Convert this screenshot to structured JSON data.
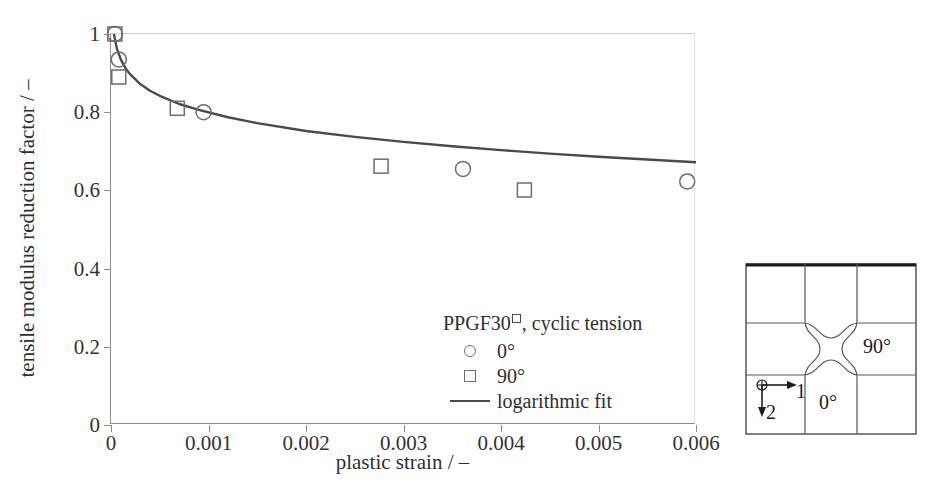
{
  "chart_data": {
    "type": "scatter",
    "title": "",
    "xlabel": "plastic strain / –",
    "ylabel": "tensile modulus reduction factor / –",
    "xlim": [
      0,
      0.006
    ],
    "ylim": [
      0,
      1.0
    ],
    "grid": false,
    "legend_position": "inside-bottom-center",
    "xticks": [
      "0",
      "0.001",
      "0.002",
      "0.003",
      "0.004",
      "0.005",
      "0.006"
    ],
    "xtick_values": [
      0,
      0.001,
      0.002,
      0.003,
      0.004,
      0.005,
      0.006
    ],
    "yticks": [
      "0",
      "0.2",
      "0.4",
      "0.6",
      "0.8",
      "1"
    ],
    "ytick_values": [
      0,
      0.2,
      0.4,
      0.6,
      0.8,
      1.0
    ],
    "legend_title": "PPGF30",
    "legend_title_suffix": ", cyclic tension",
    "series": [
      {
        "name": "0°",
        "marker": "circle",
        "color": "#6d6d6d",
        "x": [
          4e-05,
          8e-05,
          0.00095,
          0.00361,
          0.00591
        ],
        "y": [
          1.0,
          0.935,
          0.8,
          0.655,
          0.623
        ]
      },
      {
        "name": "90°",
        "marker": "square",
        "color": "#6d6d6d",
        "x": [
          4e-05,
          8e-05,
          0.00068,
          0.00277,
          0.00424
        ],
        "y": [
          1.0,
          0.89,
          0.81,
          0.662,
          0.601
        ]
      },
      {
        "name": "logarithmic fit",
        "marker": "line",
        "color": "#4a4a4a",
        "x": [
          3e-05,
          6e-05,
          0.0001,
          0.00015,
          0.0002,
          0.0003,
          0.0004,
          0.0005,
          0.0007,
          0.0009,
          0.0012,
          0.0015,
          0.002,
          0.0025,
          0.003,
          0.0035,
          0.004,
          0.0045,
          0.005,
          0.0055,
          0.006
        ],
        "y": [
          1.0,
          0.963,
          0.935,
          0.912,
          0.896,
          0.872,
          0.855,
          0.842,
          0.821,
          0.806,
          0.787,
          0.772,
          0.752,
          0.737,
          0.724,
          0.713,
          0.703,
          0.694,
          0.686,
          0.679,
          0.672
        ]
      }
    ]
  },
  "axes": {
    "ylabel": "tensile modulus reduction factor / –",
    "xlabel": "plastic strain / –"
  },
  "legend": {
    "title_main": "PPGF30",
    "title_rest": ", cyclic tension",
    "entries": [
      {
        "key": "circle-marker",
        "label": "0°"
      },
      {
        "key": "square-marker",
        "label": "90°"
      },
      {
        "key": "solid-line",
        "label": "logarithmic fit"
      }
    ]
  },
  "inset": {
    "name": "specimen-cutout-diagram",
    "label_vertical": "0°",
    "label_horizontal": "90°",
    "axis_1": "1",
    "axis_2": "2"
  }
}
